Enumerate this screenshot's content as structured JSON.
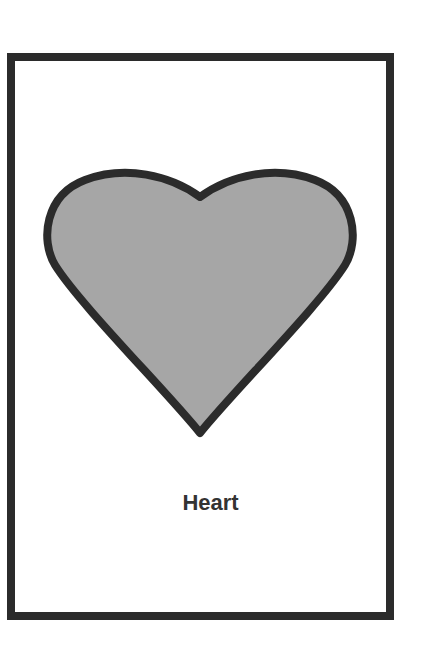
{
  "card": {
    "shape": "heart-icon",
    "label": "Heart",
    "fill_color": "#a6a6a6",
    "stroke_color": "#2b2b2b"
  }
}
